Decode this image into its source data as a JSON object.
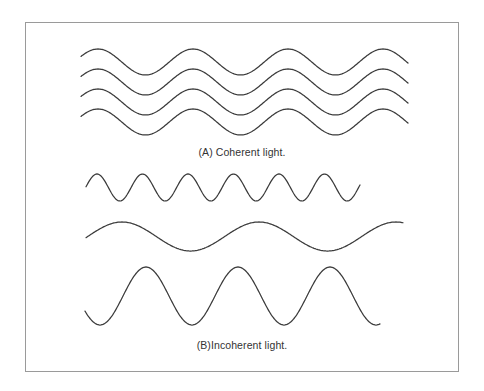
{
  "figure": {
    "frame_color": "#9a9a9a",
    "line_color": "#3a3a3a",
    "panel_a": {
      "caption": "(A) Coherent light.",
      "waves": [
        {
          "x_start": 81,
          "x_end": 408,
          "center_y": 62,
          "amplitude": 13,
          "period": 95,
          "first_peak_x": 98
        },
        {
          "x_start": 81,
          "x_end": 408,
          "center_y": 82,
          "amplitude": 13,
          "period": 95,
          "first_peak_x": 98
        },
        {
          "x_start": 81,
          "x_end": 408,
          "center_y": 102,
          "amplitude": 13,
          "period": 95,
          "first_peak_x": 98
        },
        {
          "x_start": 81,
          "x_end": 408,
          "center_y": 122,
          "amplitude": 13,
          "period": 95,
          "first_peak_x": 98
        }
      ]
    },
    "panel_b": {
      "caption": "(B)Incoherent light.",
      "waves": [
        {
          "x_start": 86,
          "x_end": 360,
          "center_y": 187.5,
          "amplitude": 13.5,
          "period": 45.5,
          "first_peak_x": 97
        },
        {
          "x_start": 86,
          "x_end": 403,
          "center_y": 236.5,
          "amplitude": 14.5,
          "period": 137,
          "first_peak_x": 122
        },
        {
          "x_start": 85,
          "x_end": 380,
          "center_y": 296,
          "amplitude": 29,
          "period": 92,
          "first_peak_x": 146
        }
      ]
    }
  }
}
